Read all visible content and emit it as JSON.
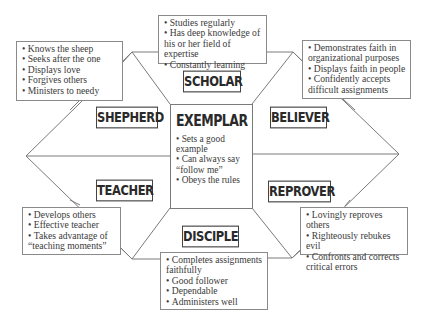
{
  "diagram": {
    "center": {
      "title": "EXEMPLAR",
      "items": [
        "Sets a good example",
        "Can always say “follow me”",
        "Obeys the rules"
      ]
    },
    "roles": [
      {
        "id": "scholar",
        "label": "SCHOLAR",
        "items": [
          "Studies regularly",
          "Has deep knowledge of his or her field of expertise",
          "Constantly learning"
        ]
      },
      {
        "id": "shepherd",
        "label": "SHEPHERD",
        "items": [
          "Knows the sheep",
          "Seeks after the one",
          "Displays love",
          "Forgives others",
          "Ministers to needy"
        ]
      },
      {
        "id": "believer",
        "label": "BELIEVER",
        "items": [
          "Demonstrates faith in organizational purposes",
          "Displays faith in people",
          "Confidently accepts difficult assignments"
        ]
      },
      {
        "id": "teacher",
        "label": "TEACHER",
        "items": [
          "Develops others",
          "Effective teacher",
          "Takes advantage of “teaching moments”"
        ]
      },
      {
        "id": "reprover",
        "label": "REPROVER",
        "items": [
          "Lovingly reproves others",
          "Righteously rebukes evil",
          "Confronts and corrects critical errors"
        ]
      },
      {
        "id": "disciple",
        "label": "DISCIPLE",
        "items": [
          "Completes assignments faithfully",
          "Good follower",
          "Dependable",
          "Administers well"
        ]
      }
    ],
    "colors": {
      "line": "#7a7a7a",
      "text": "#3a3a3a",
      "background": "#ffffff"
    }
  }
}
